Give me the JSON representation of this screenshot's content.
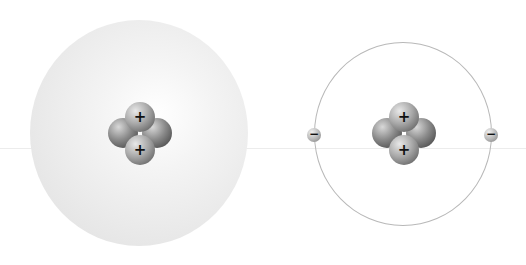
{
  "diagram": {
    "atoms": [
      {
        "model": "electron-cloud",
        "nucleus": {
          "protons": 2,
          "neutrons": 2,
          "proton_label": "+"
        },
        "cloud_color": "#e0e0e0"
      },
      {
        "model": "orbit",
        "nucleus": {
          "protons": 2,
          "neutrons": 2,
          "proton_label": "+"
        },
        "electrons": [
          {
            "label": "−"
          },
          {
            "label": "−"
          }
        ],
        "orbit_color": "#b8b8b8"
      }
    ]
  }
}
